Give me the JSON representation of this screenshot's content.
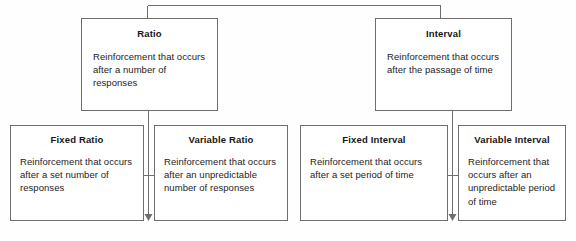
{
  "diagram": {
    "type": "hierarchy-flowchart",
    "line_color": "#6e6e6e",
    "text_color": "#1d1d1d",
    "background": "#fefefe"
  },
  "tier_top": [
    {
      "id": "ratio",
      "title": "Ratio",
      "body": "Reinforcement that occurs after a number of responses"
    },
    {
      "id": "interval",
      "title": "Interval",
      "body": "Reinforcement that occurs after the passage of time"
    }
  ],
  "tier_bottom": [
    {
      "id": "fixed-ratio",
      "title": "Fixed Ratio",
      "body": "Reinforcement that occurs after a set number of responses"
    },
    {
      "id": "variable-ratio",
      "title": "Variable Ratio",
      "body": "Reinforcement that occurs after an unpredictable number of responses"
    },
    {
      "id": "fixed-interval",
      "title": "Fixed Interval",
      "body": "Reinforcement that occurs after a set period of time"
    },
    {
      "id": "variable-interval",
      "title": "Variable Interval",
      "body": "Reinforcement that occurs after an unpredictable period of time"
    }
  ],
  "connectors": [
    {
      "name": "root-bus",
      "from": "ratio",
      "to": "interval"
    },
    {
      "name": "ratio-split",
      "from": "ratio",
      "to": "fixed-ratio / variable-ratio"
    },
    {
      "name": "interval-split",
      "from": "interval",
      "to": "fixed-interval / variable-interval"
    }
  ]
}
